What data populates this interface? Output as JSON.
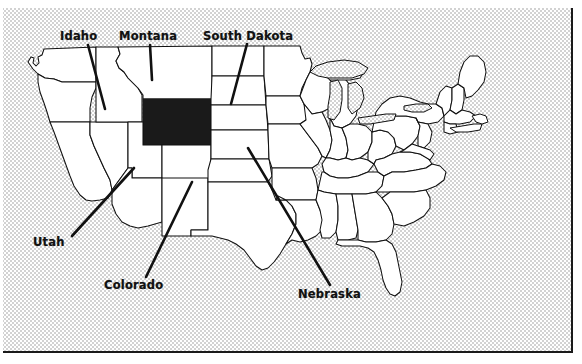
{
  "figure": {
    "type": "choropleth-locator-map",
    "region": "United States",
    "background_style": "halftone-gray-dither",
    "frame_color": "#1a1a1a",
    "land_fill": "#ffffff",
    "border_stroke": "#111111",
    "highlight_fill": "#1a1a1a",
    "highlight_state": "Wyoming",
    "water_fill": "#d9d9d9"
  },
  "labels": [
    {
      "id": "idaho",
      "text": "Idaho",
      "x": 60,
      "y": 29,
      "anchor_x": 88,
      "anchor_y": 45,
      "leader_x": 105,
      "leader_y": 109
    },
    {
      "id": "montana",
      "text": "Montana",
      "x": 119,
      "y": 29,
      "anchor_x": 150,
      "anchor_y": 45,
      "leader_x": 152,
      "leader_y": 80
    },
    {
      "id": "south-dakota",
      "text": "South Dakota",
      "x": 203,
      "y": 29,
      "anchor_x": 247,
      "anchor_y": 44,
      "leader_x": 231,
      "leader_y": 104
    },
    {
      "id": "utah",
      "text": "Utah",
      "x": 33,
      "y": 235,
      "anchor_x": 72,
      "anchor_y": 236,
      "leader_x": 134,
      "leader_y": 168
    },
    {
      "id": "colorado",
      "text": "Colorado",
      "x": 104,
      "y": 278,
      "anchor_x": 146,
      "anchor_y": 277,
      "leader_x": 192,
      "leader_y": 182
    },
    {
      "id": "nebraska",
      "text": "Nebraska",
      "x": 298,
      "y": 287,
      "anchor_x": 330,
      "anchor_y": 285,
      "leader_x": 248,
      "leader_y": 148
    }
  ],
  "highlight": {
    "name": "Wyoming",
    "rect": {
      "x": 143,
      "y": 99,
      "width": 68,
      "height": 46
    }
  }
}
